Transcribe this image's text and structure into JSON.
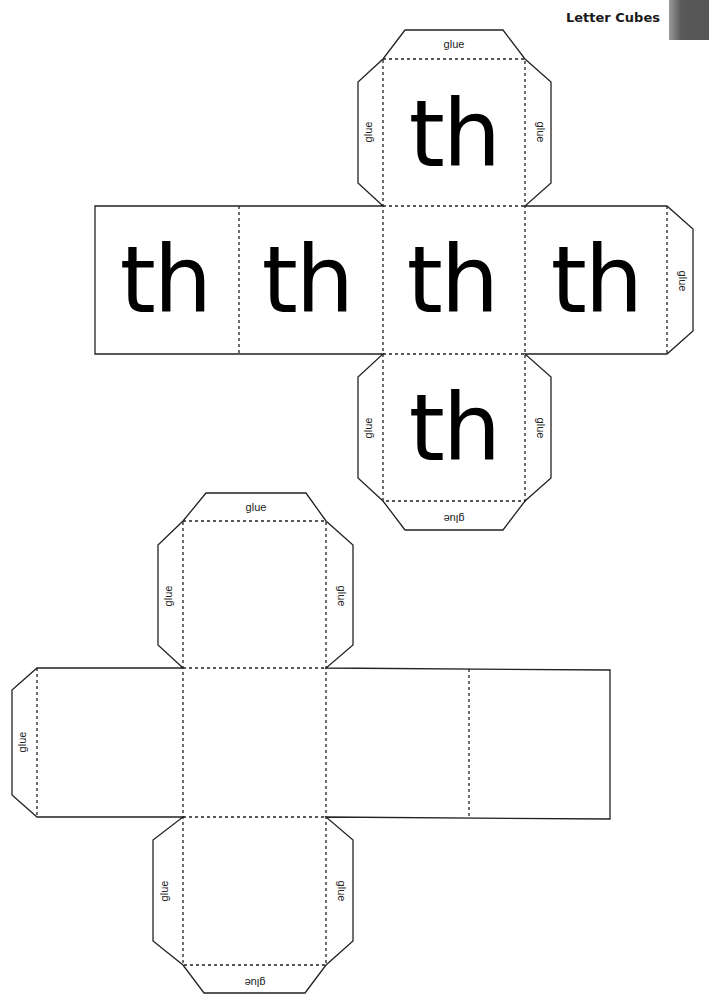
{
  "header": {
    "title": "Letter Cubes"
  },
  "glue_label": "glue",
  "cube_1": {
    "letters": "th",
    "faces": [
      {
        "position": "top",
        "letters": "th"
      },
      {
        "position": "far-left",
        "letters": "th"
      },
      {
        "position": "left",
        "letters": "th"
      },
      {
        "position": "center",
        "letters": "th"
      },
      {
        "position": "right",
        "letters": "th"
      },
      {
        "position": "bottom",
        "letters": "th"
      }
    ],
    "glue_tabs": [
      "top-top",
      "top-left",
      "top-right",
      "right-end",
      "bottom-left",
      "bottom-right",
      "bottom-bottom"
    ]
  },
  "cube_2": {
    "letters": "",
    "faces": [
      {
        "position": "top",
        "letters": ""
      },
      {
        "position": "left",
        "letters": ""
      },
      {
        "position": "center",
        "letters": ""
      },
      {
        "position": "right",
        "letters": ""
      },
      {
        "position": "far-right",
        "letters": ""
      },
      {
        "position": "bottom",
        "letters": ""
      }
    ],
    "glue_tabs": [
      "top-top",
      "top-left",
      "top-right",
      "left-end",
      "bottom-left",
      "bottom-right",
      "bottom-bottom"
    ]
  },
  "colors": {
    "line": "#222222",
    "letters": "#000000",
    "edge_tab": "#555555"
  }
}
